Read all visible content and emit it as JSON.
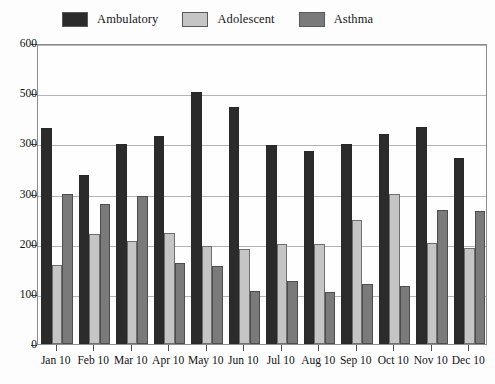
{
  "chart_data": {
    "type": "bar",
    "title": "",
    "xlabel": "",
    "ylabel": "",
    "ylim": [
      0,
      600
    ],
    "yticks": [
      0,
      100,
      200,
      300,
      400,
      500,
      600
    ],
    "grid": true,
    "legend_position": "top",
    "categories": [
      "Jan 10",
      "Feb 10",
      "Mar 10",
      "Apr 10",
      "May 10",
      "Jun 10",
      "Jul 10",
      "Aug 10",
      "Sep 10",
      "Oct 10",
      "Nov 10",
      "Dec 10"
    ],
    "series": [
      {
        "name": "Ambulatory",
        "color": "#2b2b2b",
        "values": [
          430,
          337,
          398,
          415,
          502,
          473,
          397,
          385,
          398,
          418,
          432,
          370
        ]
      },
      {
        "name": "Adolescent",
        "color": "#c5c5c5",
        "values": [
          157,
          220,
          205,
          222,
          195,
          190,
          200,
          200,
          248,
          300,
          202,
          192
        ]
      },
      {
        "name": "Asthma",
        "color": "#7a7a7a",
        "values": [
          300,
          280,
          295,
          162,
          155,
          105,
          125,
          103,
          120,
          116,
          268,
          265
        ]
      }
    ]
  },
  "axes": {
    "ytick_labels": [
      "600",
      "500",
      "300",
      "300",
      "200",
      "100",
      "0"
    ],
    "ytick_values": [
      600,
      500,
      400,
      300,
      200,
      100,
      0
    ]
  }
}
